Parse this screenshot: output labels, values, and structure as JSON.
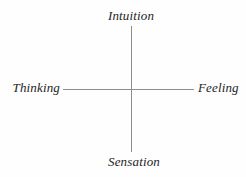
{
  "diagram": {
    "type": "axis-cross",
    "background_color": "#fefefe",
    "line_color": "#8d8d8d",
    "text_color": "#1d1d1d",
    "labels": {
      "top": "Intuition",
      "bottom": "Sensation",
      "left": "Thinking",
      "right": "Feeling"
    },
    "axes": {
      "vertical": {
        "name": "Intuition-Sensation axis",
        "top_label": "Intuition",
        "bottom_label": "Sensation"
      },
      "horizontal": {
        "name": "Thinking-Feeling axis",
        "left_label": "Thinking",
        "right_label": "Feeling"
      }
    }
  },
  "chart_data": {
    "type": "scatter",
    "title": "",
    "subtitle": "",
    "xlabel": "",
    "ylabel": "",
    "grid": false,
    "legend": null,
    "annotations": [
      {
        "text": "Intuition",
        "position": "top",
        "anchor": "vertical-axis-top"
      },
      {
        "text": "Sensation",
        "position": "bottom",
        "anchor": "vertical-axis-bottom"
      },
      {
        "text": "Thinking",
        "position": "left",
        "anchor": "horizontal-axis-left"
      },
      {
        "text": "Feeling",
        "position": "right",
        "anchor": "horizontal-axis-right"
      }
    ],
    "x": [],
    "y": [],
    "series": []
  }
}
